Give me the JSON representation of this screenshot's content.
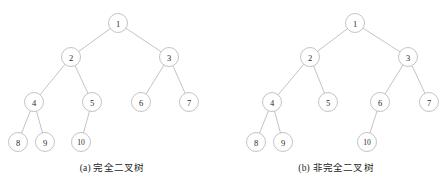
{
  "figure": {
    "width": 448,
    "height": 181,
    "background_color": "#ffffff",
    "node_stroke_color": "#a9a9a9",
    "edge_stroke_color": "#a9a9a9",
    "node_fill_color": "#ffffff",
    "label_color": "#2a2a2a",
    "node_radius": 9.5
  },
  "panels": [
    {
      "id": "a",
      "caption": "(a) 完全二叉树",
      "caption_label": "(a)",
      "caption_text": "完全二叉树",
      "nodes": [
        {
          "id": "n1",
          "label": "1",
          "x": 118,
          "y": 23
        },
        {
          "id": "n2",
          "label": "2",
          "x": 71,
          "y": 57
        },
        {
          "id": "n3",
          "label": "3",
          "x": 169,
          "y": 57
        },
        {
          "id": "n4",
          "label": "4",
          "x": 34,
          "y": 102
        },
        {
          "id": "n5",
          "label": "5",
          "x": 92,
          "y": 102
        },
        {
          "id": "n6",
          "label": "6",
          "x": 141,
          "y": 102
        },
        {
          "id": "n7",
          "label": "7",
          "x": 189,
          "y": 102
        },
        {
          "id": "n8",
          "label": "8",
          "x": 18,
          "y": 142
        },
        {
          "id": "n9",
          "label": "9",
          "x": 45,
          "y": 142
        },
        {
          "id": "n10",
          "label": "10",
          "x": 81,
          "y": 142
        }
      ],
      "edges": [
        {
          "from": "n1",
          "to": "n2"
        },
        {
          "from": "n1",
          "to": "n3"
        },
        {
          "from": "n2",
          "to": "n4"
        },
        {
          "from": "n2",
          "to": "n5"
        },
        {
          "from": "n3",
          "to": "n6"
        },
        {
          "from": "n3",
          "to": "n7"
        },
        {
          "from": "n4",
          "to": "n8"
        },
        {
          "from": "n4",
          "to": "n9"
        },
        {
          "from": "n5",
          "to": "n10"
        }
      ]
    },
    {
      "id": "b",
      "caption": "(b) 非完全二叉树",
      "caption_label": "(b)",
      "caption_text": "非完全二叉树",
      "nodes": [
        {
          "id": "n1",
          "label": "1",
          "x": 131,
          "y": 23
        },
        {
          "id": "n2",
          "label": "2",
          "x": 86,
          "y": 57
        },
        {
          "id": "n3",
          "label": "3",
          "x": 184,
          "y": 57
        },
        {
          "id": "n4",
          "label": "4",
          "x": 48,
          "y": 102
        },
        {
          "id": "n5",
          "label": "5",
          "x": 104,
          "y": 102
        },
        {
          "id": "n6",
          "label": "6",
          "x": 156,
          "y": 102
        },
        {
          "id": "n7",
          "label": "7",
          "x": 205,
          "y": 102
        },
        {
          "id": "n8",
          "label": "8",
          "x": 32,
          "y": 142
        },
        {
          "id": "n9",
          "label": "9",
          "x": 59,
          "y": 142
        },
        {
          "id": "n10",
          "label": "10",
          "x": 143,
          "y": 142
        }
      ],
      "edges": [
        {
          "from": "n1",
          "to": "n2"
        },
        {
          "from": "n1",
          "to": "n3"
        },
        {
          "from": "n2",
          "to": "n4"
        },
        {
          "from": "n2",
          "to": "n5"
        },
        {
          "from": "n3",
          "to": "n6"
        },
        {
          "from": "n3",
          "to": "n7"
        },
        {
          "from": "n4",
          "to": "n8"
        },
        {
          "from": "n4",
          "to": "n9"
        },
        {
          "from": "n6",
          "to": "n10"
        }
      ]
    }
  ]
}
